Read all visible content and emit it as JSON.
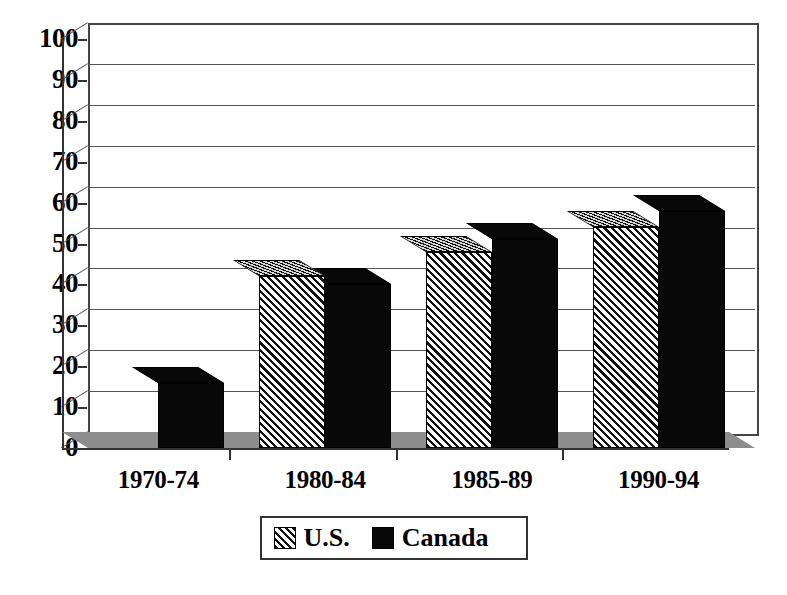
{
  "chart_data": {
    "type": "bar",
    "title": "",
    "subtitle": "",
    "xlabel": "",
    "ylabel": "",
    "categories": [
      "1970-74",
      "1980-84",
      "1985-89",
      "1990-94"
    ],
    "series": [
      {
        "name": "U.S.",
        "values": [
          0,
          42,
          48,
          54
        ],
        "pattern": "diagonal-hatch",
        "color": "#f2f2f2"
      },
      {
        "name": "Canada",
        "values": [
          16,
          40,
          51,
          58
        ],
        "pattern": "solid",
        "color": "#080808"
      }
    ],
    "ylim": [
      0,
      100
    ],
    "yticks": [
      0,
      10,
      20,
      30,
      40,
      50,
      60,
      70,
      80,
      90,
      100
    ],
    "ytick_labels": [
      "0",
      "10",
      "20",
      "30",
      "40",
      "50",
      "60",
      "70",
      "80",
      "90",
      "100"
    ],
    "grid": true,
    "grid_axis": "y",
    "legend": [
      "U.S.",
      "Canada"
    ],
    "legend_position": "bottom-center",
    "style": "3d-bar",
    "floor_color": "#8d8d8d",
    "axis_color": "#333333"
  },
  "legend": {
    "items": [
      {
        "label": "U.S.",
        "swatch": "hatch-swatch-icon"
      },
      {
        "label": "Canada",
        "swatch": "black-swatch-icon"
      }
    ]
  }
}
